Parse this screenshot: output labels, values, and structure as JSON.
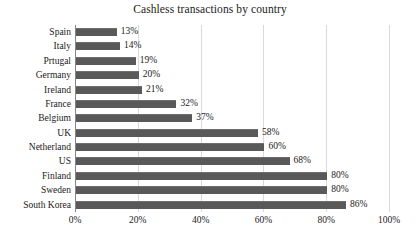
{
  "chart_data": {
    "type": "bar",
    "orientation": "horizontal",
    "title": "Cashless transactions by country",
    "xlabel": "",
    "ylabel": "",
    "xlim": [
      0,
      100
    ],
    "grid": true,
    "legend": "none",
    "value_suffix": "%",
    "categories": [
      "Spain",
      "Italy",
      "Prtugal",
      "Germany",
      "Ireland",
      "France",
      "Belgium",
      "UK",
      "Netherland",
      "US",
      "Finland",
      "Sweden",
      "South Korea"
    ],
    "values": [
      13,
      14,
      19,
      20,
      21,
      32,
      37,
      58,
      60,
      68,
      80,
      80,
      86
    ],
    "data_labels": [
      "13%",
      "14%",
      "19%",
      "20%",
      "21%",
      "32%",
      "37%",
      "58%",
      "60%",
      "68%",
      "80%",
      "80%",
      "86%"
    ],
    "xticks": [
      0,
      20,
      40,
      60,
      80,
      100
    ],
    "xtick_labels": [
      "0%",
      "20%",
      "40%",
      "60%",
      "80%",
      "100%"
    ],
    "colors": {
      "bar": "#595959",
      "bar_edge": "#6e6e6e",
      "gridline": "#d9d9d9",
      "axis": "#868686",
      "text": "#1a1a1a",
      "background": "#ffffff"
    }
  }
}
